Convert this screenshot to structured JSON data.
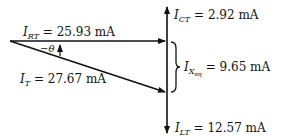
{
  "diagram": {
    "type": "phasor-diagram",
    "vectors": [
      {
        "id": "I_RT",
        "symbol": "I",
        "subscript": "RT",
        "value": "25.93 mA",
        "direction": "right"
      },
      {
        "id": "I_CT",
        "symbol": "I",
        "subscript": "CT",
        "value": "2.92 mA",
        "direction": "up"
      },
      {
        "id": "I_LT",
        "symbol": "I",
        "subscript": "LT",
        "value": "12.57 mA",
        "direction": "down"
      },
      {
        "id": "I_T",
        "symbol": "I",
        "subscript": "T",
        "value": "27.67 mA",
        "direction": "down-right"
      }
    ],
    "brace_label": {
      "symbol": "I",
      "subscript": "X",
      "sub_subscript": "eq",
      "value": "9.65 mA"
    },
    "angle_label": "−θ",
    "colors": {
      "line": "#111111",
      "background": "#ffffff"
    }
  }
}
